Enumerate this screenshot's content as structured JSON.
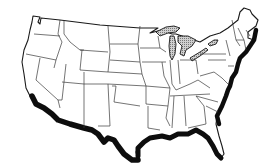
{
  "map": {
    "title": "Contiguous United States outline map",
    "region": "Contiguous United States",
    "legend": [],
    "highlighted_features": [
      {
        "id": "coastal-band",
        "description": "Thick black band along the Pacific coast of southern California, the Mexican border, the Gulf Coast and the Atlantic seaboard",
        "color": "#0d0d0d"
      },
      {
        "id": "great-lakes",
        "description": "Great Lakes drawn with a gray stippled/hatched fill",
        "color": "#9a9a9a"
      }
    ],
    "colors": {
      "background": "#ffffff",
      "land": "#ffffff",
      "border": "#1a1a1a",
      "state_lines": "#3a3a3a",
      "band": "#0d0d0d",
      "lakes": "#9a9a9a"
    }
  }
}
